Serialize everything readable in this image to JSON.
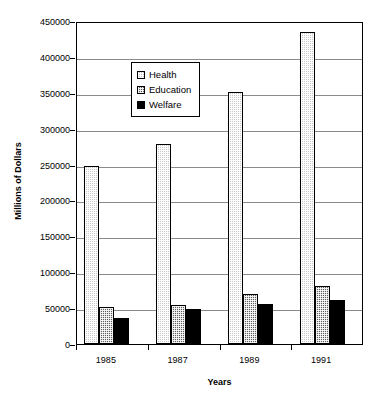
{
  "chart_data": {
    "type": "bar",
    "title": "",
    "xlabel": "Years",
    "ylabel": "Millions of Dollars",
    "categories": [
      "1985",
      "1987",
      "1989",
      "1991"
    ],
    "series": [
      {
        "name": "Health",
        "values": [
          248000,
          279000,
          351000,
          435000
        ],
        "color": "#c9c9c9",
        "pattern": "light-dotted"
      },
      {
        "name": "Education",
        "values": [
          52000,
          54000,
          70000,
          81000
        ],
        "color": "#5e5e5e",
        "pattern": "dark-crosshatch"
      },
      {
        "name": "Welfare",
        "values": [
          36000,
          49000,
          56000,
          61000
        ],
        "color": "#000000",
        "pattern": "solid"
      }
    ],
    "ylim": [
      0,
      450000
    ],
    "yticks": [
      0,
      50000,
      100000,
      150000,
      200000,
      250000,
      300000,
      350000,
      400000,
      450000
    ],
    "ytick_labels": [
      "0",
      "50000",
      "100000",
      "150000",
      "200000",
      "250000",
      "300000",
      "350000",
      "400000",
      "450000"
    ],
    "grid": true,
    "legend_position": "upper-left-inside",
    "legend_entries": [
      "Health",
      "Education",
      "Welfare"
    ]
  },
  "axes": {
    "y_title": "Millions of Dollars",
    "x_title": "Years"
  },
  "legend": {
    "items": [
      {
        "label": "Health"
      },
      {
        "label": "Education"
      },
      {
        "label": "Welfare"
      }
    ]
  }
}
